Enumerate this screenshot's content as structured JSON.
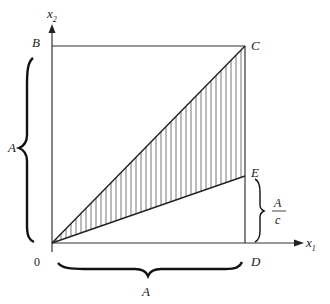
{
  "axes": {
    "x_label": "x",
    "x_sub": "1",
    "y_label": "x",
    "y_sub": "2",
    "origin_label": "0"
  },
  "points": {
    "B": "B",
    "C": "C",
    "D": "D",
    "E": "E"
  },
  "braces": {
    "left_label": "A",
    "bottom_label": "A",
    "right_numerator": "A",
    "right_denominator": "c"
  },
  "colors": {
    "line": "#333333",
    "hatch": "#555555"
  }
}
